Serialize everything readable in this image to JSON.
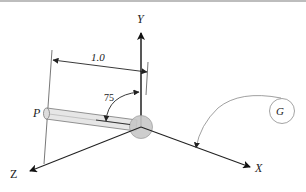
{
  "diagram": {
    "axes": {
      "x_label": "X",
      "y_label": "Y",
      "z_label": "Z"
    },
    "point_label": "P",
    "dimension_label": "1.0",
    "angle_label": "75",
    "ground_label": "G",
    "colors": {
      "line": "#222222",
      "rod_fill": "#e6e6e6",
      "sphere_fill": "#c8c8c8",
      "thin_line": "#888888"
    }
  }
}
